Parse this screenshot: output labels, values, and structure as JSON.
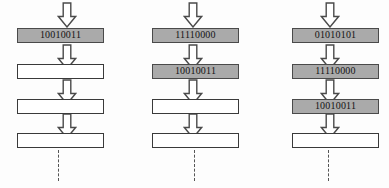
{
  "diagram": {
    "background_color": "#fdfdfd",
    "box_fill_color": "#aaaaaa",
    "box_empty_color": "#ffffff",
    "box_border_color": "#3a3a3a",
    "arrow_stroke_color": "#4a4a4a",
    "dashed_line_color": "#555555",
    "columns": [
      {
        "name": "column-1",
        "left": 17,
        "arrow_center_x": 67,
        "dashed_line_x": 58,
        "arrows": [
          {
            "name": "arrow-in",
            "y": 2
          },
          {
            "name": "arrow-stage-1-to-2",
            "y": 44
          },
          {
            "name": "arrow-stage-2-to-3",
            "y": 79
          },
          {
            "name": "arrow-stage-3-to-4",
            "y": 113
          }
        ],
        "stages": [
          {
            "name": "stage-1",
            "y": 28,
            "value": "10010011",
            "filled": true
          },
          {
            "name": "stage-2",
            "y": 64,
            "value": "",
            "filled": false
          },
          {
            "name": "stage-3",
            "y": 99,
            "value": "",
            "filled": false
          },
          {
            "name": "stage-4",
            "y": 133,
            "value": "",
            "filled": false
          }
        ],
        "dashed_line": {
          "name": "continuation-line",
          "top": 150,
          "height": 31
        }
      },
      {
        "name": "column-2",
        "left": 152,
        "arrow_center_x": 193,
        "dashed_line_x": 194,
        "arrows": [
          {
            "name": "arrow-in",
            "y": 2
          },
          {
            "name": "arrow-stage-1-to-2",
            "y": 44
          },
          {
            "name": "arrow-stage-2-to-3",
            "y": 79
          },
          {
            "name": "arrow-stage-3-to-4",
            "y": 113
          }
        ],
        "stages": [
          {
            "name": "stage-1",
            "y": 28,
            "value": "11110000",
            "filled": true
          },
          {
            "name": "stage-2",
            "y": 64,
            "value": "10010011",
            "filled": true
          },
          {
            "name": "stage-3",
            "y": 99,
            "value": "",
            "filled": false
          },
          {
            "name": "stage-4",
            "y": 133,
            "value": "",
            "filled": false
          }
        ],
        "dashed_line": {
          "name": "continuation-line",
          "top": 150,
          "height": 31
        }
      },
      {
        "name": "column-3",
        "left": 292,
        "arrow_center_x": 330,
        "dashed_line_x": 328,
        "arrows": [
          {
            "name": "arrow-in",
            "y": 2
          },
          {
            "name": "arrow-stage-1-to-2",
            "y": 44
          },
          {
            "name": "arrow-stage-2-to-3",
            "y": 79
          },
          {
            "name": "arrow-stage-3-to-4",
            "y": 113
          }
        ],
        "stages": [
          {
            "name": "stage-1",
            "y": 28,
            "value": "01010101",
            "filled": true
          },
          {
            "name": "stage-2",
            "y": 64,
            "value": "11110000",
            "filled": true
          },
          {
            "name": "stage-3",
            "y": 99,
            "value": "10010011",
            "filled": true
          },
          {
            "name": "stage-4",
            "y": 133,
            "value": "",
            "filled": false
          }
        ],
        "dashed_line": {
          "name": "continuation-line",
          "top": 150,
          "height": 31
        }
      }
    ]
  }
}
